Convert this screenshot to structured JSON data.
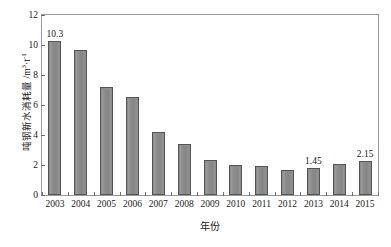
{
  "chart_data": {
    "type": "bar",
    "title": "",
    "subtitle": "",
    "xlabel": "年份",
    "ylabel": "吨钢新水消耗量 /m³·t⁻¹",
    "ylabel_main": "吨钢新水消耗量 /m",
    "ylabel_unit_sup1": "3",
    "ylabel_unit_mid": "·t",
    "ylabel_unit_sup2": "-1",
    "categories": [
      "2003",
      "2004",
      "2005",
      "2006",
      "2007",
      "2008",
      "2009",
      "2010",
      "2011",
      "2012",
      "2013",
      "2014",
      "2015"
    ],
    "values": [
      10.3,
      9.7,
      7.2,
      6.55,
      4.2,
      3.4,
      2.35,
      2.0,
      1.95,
      1.7,
      1.8,
      2.05,
      2.25
    ],
    "point_labels": [
      "10.3",
      "",
      "",
      "",
      "",
      "",
      "",
      "",
      "",
      "",
      "1.45",
      "",
      "2.15"
    ],
    "ylim": [
      0,
      12
    ],
    "yticks": [
      "0",
      "2",
      "4",
      "6",
      "8",
      "10",
      "12"
    ],
    "ytick_values": [
      0,
      2,
      4,
      6,
      8,
      10,
      12
    ],
    "grid": false,
    "legend": null,
    "bar_color": "#8d8d8d",
    "bar_edge_color": "#545454",
    "axis_color": "#9a9a9a",
    "background": "#ffffff"
  }
}
